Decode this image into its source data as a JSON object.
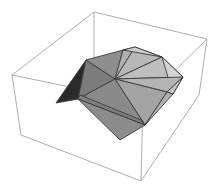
{
  "figure": {
    "type": "3d-graphics",
    "width": 218,
    "height": 195
  },
  "colors": {
    "background": "#ffffff",
    "box_edge": "#9a9a9a",
    "face_edge": "#3a3a3a"
  },
  "bounding_box": {
    "vertices": {
      "top_back": [
        94,
        12
      ],
      "top_left": [
        12,
        75
      ],
      "top_right": [
        207,
        39
      ],
      "top_front": [
        143,
        102
      ],
      "bottom_left": [
        21,
        135
      ],
      "bottom_front": [
        141,
        181
      ],
      "bottom_right": [
        199,
        95
      ],
      "bottom_back": [
        94,
        60
      ]
    },
    "edges": [
      [
        "top_back",
        "top_left"
      ],
      [
        "top_back",
        "top_right"
      ],
      [
        "top_left",
        "top_front"
      ],
      [
        "top_right",
        "top_front"
      ],
      [
        "top_left",
        "bottom_left"
      ],
      [
        "top_front",
        "bottom_front"
      ],
      [
        "top_right",
        "bottom_right"
      ],
      [
        "bottom_left",
        "bottom_front"
      ],
      [
        "bottom_front",
        "bottom_right"
      ],
      [
        "top_back",
        "bottom_back"
      ]
    ]
  },
  "polyhedron": {
    "faces": [
      {
        "name": "dark-left-face",
        "points": "56,103 86,60 78,99",
        "fill": "#2a2a2a"
      },
      {
        "name": "left-upper-face",
        "points": "86,60 115,79 78,99",
        "fill": "#7c7c7c"
      },
      {
        "name": "top-left-face",
        "points": "86,60 123,50 115,79",
        "fill": "#8e8e8e"
      },
      {
        "name": "top-center-face",
        "points": "123,50 135,47 115,79",
        "fill": "#b0b0b0"
      },
      {
        "name": "top-mid-face",
        "points": "135,47 162,57 115,79",
        "fill": "#b8b8b8"
      },
      {
        "name": "upper-right-face",
        "points": "162,57 183,77 115,79",
        "fill": "#bebebe"
      },
      {
        "name": "top-strip-face",
        "points": "123,50 135,47 162,57",
        "fill": "#cfcfcf"
      },
      {
        "name": "right-edge-face",
        "points": "162,57 183,77 173,94",
        "fill": "#d4d4d4"
      },
      {
        "name": "right-mid-face",
        "points": "115,79 183,77 167,92",
        "fill": "#b4b4b4"
      },
      {
        "name": "right-lower-face",
        "points": "183,77 173,94 167,92",
        "fill": "#c8c8c8"
      },
      {
        "name": "center-right-face",
        "points": "115,79 167,92 145,125",
        "fill": "#a4a4a4"
      },
      {
        "name": "far-right-side-face",
        "points": "167,92 173,94 145,125",
        "fill": "#b0b0b0"
      },
      {
        "name": "center-face",
        "points": "115,79 145,125 78,99",
        "fill": "#8a8a8a"
      },
      {
        "name": "lower-band-face",
        "points": "78,99 145,125 141,120 80,95",
        "fill": "#7e7e7e"
      },
      {
        "name": "bottom-face",
        "points": "78,99 145,125 120,140",
        "fill": "#8c8c8c"
      }
    ]
  }
}
